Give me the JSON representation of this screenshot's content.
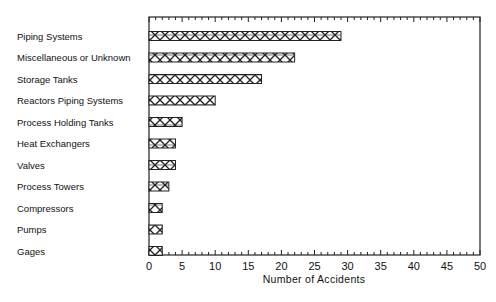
{
  "chart_data": {
    "type": "bar",
    "orientation": "horizontal",
    "title": "",
    "xlabel": "Number of Accidents",
    "ylabel": "",
    "xlim": [
      0,
      50
    ],
    "x_ticks": [
      0,
      5,
      10,
      15,
      20,
      25,
      30,
      35,
      40,
      45,
      50
    ],
    "minor_tick_step": 1,
    "grid": false,
    "legend": null,
    "bar_fill": "cross-hatch",
    "categories": [
      "Piping Systems",
      "Miscellaneous or Unknown",
      "Storage Tanks",
      "Reactors Piping Systems",
      "Process Holding Tanks",
      "Heat Exchangers",
      "Valves",
      "Process Towers",
      "Compressors",
      "Pumps",
      "Gages"
    ],
    "values": [
      29,
      22,
      17,
      10,
      5,
      4,
      4,
      3,
      2,
      2,
      2
    ]
  },
  "colors": {
    "ink": "#222222",
    "background": "#ffffff"
  }
}
